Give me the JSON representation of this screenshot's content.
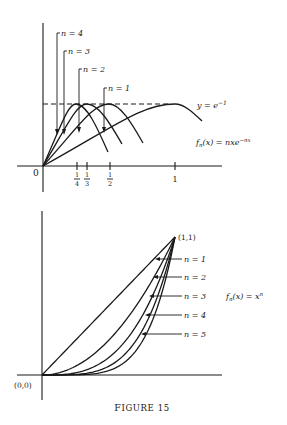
{
  "caption": "Figure 15",
  "chart_data": [
    {
      "type": "line",
      "title": "",
      "formula": "fn(x) = nxe^(−nx)",
      "formula_parts": {
        "f": "f",
        "sub": "n",
        "rest": "(x) = nxe",
        "sup": "−nx"
      },
      "series": [
        {
          "name": "n = 4",
          "peak_x": 0.25,
          "peak_y": 0.3679
        },
        {
          "name": "n = 3",
          "peak_x": 0.3333,
          "peak_y": 0.3679
        },
        {
          "name": "n = 2",
          "peak_x": 0.5,
          "peak_y": 0.3679
        },
        {
          "name": "n = 1",
          "peak_x": 1.0,
          "peak_y": 0.3679
        }
      ],
      "reference_line": {
        "label": "y = e−1",
        "label_base": "y = e",
        "label_sup": "−1",
        "y": 0.3679,
        "style": "dashed"
      },
      "x_ticks": [
        {
          "label_num": "1",
          "label_den": "4",
          "value": 0.25
        },
        {
          "label_num": "1",
          "label_den": "3",
          "value": 0.3333
        },
        {
          "label_num": "1",
          "label_den": "2",
          "value": 0.5
        },
        {
          "label": "1",
          "value": 1
        }
      ],
      "origin_label": "0",
      "xlim": [
        0,
        1.15
      ],
      "ylim": [
        0,
        0.6
      ],
      "grid": false
    },
    {
      "type": "line",
      "title": "",
      "formula": "fn(x) = x^n",
      "formula_parts": {
        "f": "f",
        "sub": "n",
        "rest": "(x) = x",
        "sup": "n"
      },
      "series": [
        {
          "name": "n = 1",
          "n": 1
        },
        {
          "name": "n = 2",
          "n": 2
        },
        {
          "name": "n = 3",
          "n": 3
        },
        {
          "name": "n = 4",
          "n": 4
        },
        {
          "name": "n = 5",
          "n": 5
        }
      ],
      "point_labels": [
        {
          "label": "(1,1)",
          "x": 1,
          "y": 1
        },
        {
          "label": "(0,0)",
          "x": 0,
          "y": 0
        }
      ],
      "xlim": [
        0,
        1.35
      ],
      "ylim": [
        0,
        1.2
      ],
      "grid": false
    }
  ]
}
